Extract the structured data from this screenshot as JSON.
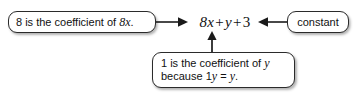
{
  "diagram": {
    "type": "annotated-algebraic-expression",
    "expression": {
      "full_text": "8x + y + 3",
      "terms": [
        "8x",
        "y",
        "3"
      ],
      "operators": [
        "+",
        "+"
      ]
    },
    "callouts": {
      "left": {
        "text": "8 is the coefficient of 8x.",
        "plain_prefix": "8 is the coefficient of ",
        "italic_part": "8x",
        "suffix": "."
      },
      "right": {
        "text": "constant"
      },
      "bottom": {
        "line1_prefix": "1 is the coefficient of ",
        "line1_italic": "y",
        "line2_prefix": "because 1",
        "line2_italic_1": "y",
        "line2_middle": " = ",
        "line2_italic_2": "y",
        "line2_suffix": ".",
        "full_text": "1 is the coefficient of y because 1y = y."
      }
    },
    "arrows": [
      {
        "name": "arrow-left-to-expression",
        "direction": "right"
      },
      {
        "name": "arrow-right-to-expression",
        "direction": "left"
      },
      {
        "name": "arrow-bottom-to-expression",
        "direction": "up"
      }
    ],
    "colors": {
      "background": "#ffffff",
      "text": "#111111",
      "border": "#2b2b2b",
      "arrow": "#1a1a1a"
    }
  }
}
